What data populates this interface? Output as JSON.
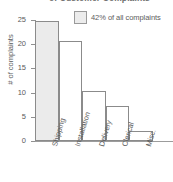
{
  "chart_data": {
    "type": "bar",
    "title_visible_fragment": "of Customer Complaints",
    "xlabel": "",
    "ylabel": "# of complaints",
    "categories": [
      "Shipping",
      "Installation",
      "Delivery",
      "Clerical",
      "Misc."
    ],
    "values": [
      24.8,
      20.7,
      10.3,
      7.3,
      2.1
    ],
    "ylim": [
      0,
      25
    ],
    "yticks": [
      0,
      5,
      10,
      15,
      20,
      25
    ],
    "ytick_labels": [
      "0",
      "5",
      "10",
      "15",
      "20",
      "25"
    ],
    "grid": false,
    "legend": {
      "position": "top-right",
      "entries": [
        {
          "label": "42% of all complaints",
          "swatch_color": "#ebebeb"
        }
      ]
    },
    "annotations": [],
    "colors": {
      "highlight_bar_fill": "#ebebeb",
      "bar_fill": "#ffffff",
      "bar_stroke": "#8b8b8b",
      "axis": "#909090",
      "text": "#5a5a5a"
    }
  }
}
